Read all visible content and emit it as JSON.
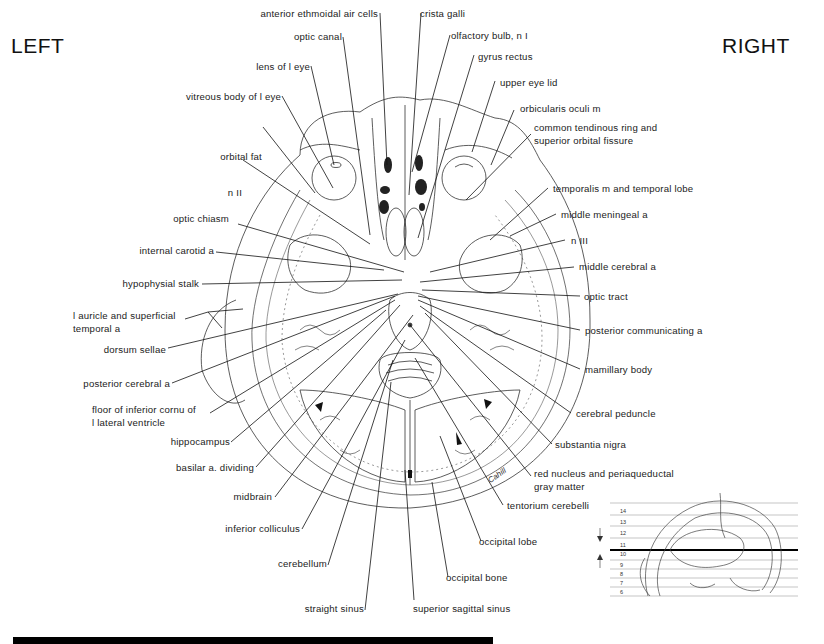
{
  "orientation": {
    "left": "LEFT",
    "right": "RIGHT"
  },
  "figure": {
    "type": "axial brain section drawing",
    "artist_signature": "Cahill",
    "labels_left": [
      {
        "id": "anterior-ethmoidal-air-cells",
        "text": "anterior ethmoidal air cells"
      },
      {
        "id": "optic-canal",
        "text": "optic canal"
      },
      {
        "id": "lens-of-l-eye",
        "text": "lens of l eye"
      },
      {
        "id": "vitreous-body-of-l-eye",
        "text": "vitreous body of l eye"
      },
      {
        "id": "orbital-fat",
        "text": "orbital fat"
      },
      {
        "id": "n-ii",
        "text": "n II"
      },
      {
        "id": "optic-chiasm",
        "text": "optic chiasm"
      },
      {
        "id": "internal-carotid-a",
        "text": "internal carotid a"
      },
      {
        "id": "hypophysial-stalk",
        "text": "hypophysial stalk"
      },
      {
        "id": "l-auricle",
        "text": "l auricle and superficial",
        "text2": "temporal a"
      },
      {
        "id": "dorsum-sellae",
        "text": "dorsum sellae"
      },
      {
        "id": "posterior-cerebral-a",
        "text": "posterior cerebral a"
      },
      {
        "id": "floor-inferior-cornu",
        "text": "floor of inferior cornu of",
        "text2": "l lateral ventricle"
      },
      {
        "id": "hippocampus",
        "text": "hippocampus"
      },
      {
        "id": "basilar-a-dividing",
        "text": "basilar a. dividing"
      },
      {
        "id": "midbrain",
        "text": "midbrain"
      },
      {
        "id": "inferior-colliculus",
        "text": "inferior colliculus"
      },
      {
        "id": "cerebellum",
        "text": "cerebellum"
      },
      {
        "id": "straight-sinus",
        "text": "straight sinus"
      }
    ],
    "labels_right": [
      {
        "id": "crista-galli",
        "text": "crista galli"
      },
      {
        "id": "olfactory-bulb",
        "text": "olfactory bulb, n I"
      },
      {
        "id": "gyrus-rectus",
        "text": "gyrus rectus"
      },
      {
        "id": "upper-eye-lid",
        "text": "upper eye lid"
      },
      {
        "id": "orbicularis-oculi-m",
        "text": "orbicularis oculi m"
      },
      {
        "id": "common-tendinous-ring",
        "text": "common tendinous ring and",
        "text2": "superior orbital fissure"
      },
      {
        "id": "temporalis-m",
        "text": "temporalis m and temporal lobe"
      },
      {
        "id": "middle-meningeal-a",
        "text": "middle meningeal a"
      },
      {
        "id": "n-iii",
        "text": "n III"
      },
      {
        "id": "middle-cerebral-a",
        "text": "middle cerebral a"
      },
      {
        "id": "optic-tract",
        "text": "optic tract"
      },
      {
        "id": "posterior-communicating-a",
        "text": "posterior communicating a"
      },
      {
        "id": "mamillary-body",
        "text": "mamillary body"
      },
      {
        "id": "cerebral-peduncle",
        "text": "cerebral peduncle"
      },
      {
        "id": "substantia-nigra",
        "text": "substantia nigra"
      },
      {
        "id": "red-nucleus",
        "text": "red nucleus and periaqueductal",
        "text2": "gray matter"
      },
      {
        "id": "tentorium-cerebelli",
        "text": "tentorium cerebelli"
      },
      {
        "id": "occipital-lobe",
        "text": "occipital lobe"
      },
      {
        "id": "occipital-bone",
        "text": "occipital bone"
      },
      {
        "id": "superior-sagittal-sinus",
        "text": "superior sagittal sinus"
      }
    ]
  },
  "inset": {
    "title": "sagittal locator",
    "section_levels": [
      "14",
      "13",
      "12",
      "11",
      "10",
      "9",
      "8",
      "7",
      "6"
    ],
    "highlighted_level_between": [
      "11",
      "10"
    ]
  },
  "colors": {
    "ink": "#1a1a1a",
    "background": "#ffffff",
    "bar": "#000000"
  }
}
